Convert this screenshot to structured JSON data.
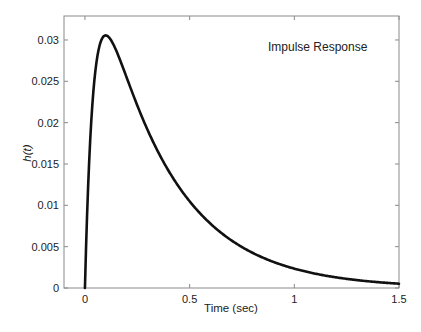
{
  "chart_data": {
    "type": "line",
    "title": "",
    "annotation": "Impulse Response",
    "xlabel": "Time (sec)",
    "ylabel": "h(t)",
    "xlim": [
      -0.1,
      1.5
    ],
    "ylim": [
      0,
      0.0329
    ],
    "grid": false,
    "legend": null,
    "x_ticks": [
      0,
      0.5,
      1,
      1.5
    ],
    "x_tick_labels": [
      "0",
      "0.5",
      "1",
      "1.5"
    ],
    "y_ticks": [
      0,
      0.005,
      0.01,
      0.015,
      0.02,
      0.025,
      0.03
    ],
    "y_tick_labels": [
      "0",
      "0.005",
      "0.01",
      "0.015",
      "0.02",
      "0.025",
      "0.03"
    ],
    "series": [
      {
        "name": "Impulse Response",
        "color": "#111111",
        "x": [
          0,
          0.01,
          0.02,
          0.03,
          0.04,
          0.05,
          0.06,
          0.07,
          0.08,
          0.1,
          0.12,
          0.14,
          0.16,
          0.18,
          0.2,
          0.25,
          0.3,
          0.35,
          0.4,
          0.45,
          0.5,
          0.6,
          0.7,
          0.8,
          0.9,
          1.0,
          1.1,
          1.2,
          1.3,
          1.4,
          1.5
        ],
        "y": [
          0,
          0.0098,
          0.0174,
          0.0231,
          0.0269,
          0.0293,
          0.0305,
          0.0309,
          0.0309,
          0.0306,
          0.0292,
          0.0272,
          0.0251,
          0.0232,
          0.0214,
          0.0172,
          0.0139,
          0.0113,
          0.0092,
          0.0076,
          0.0105,
          0.0077,
          0.0057,
          0.0043,
          0.0032,
          0.0023,
          0.0017,
          0.0013,
          0.001,
          0.0007,
          0.0005
        ]
      }
    ]
  }
}
